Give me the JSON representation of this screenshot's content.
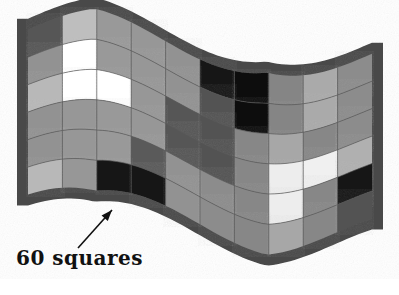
{
  "figure": {
    "kind": "wavy-checkerboard-surface",
    "title": "",
    "background_color": "#ffffff",
    "annotation": {
      "label": "60 squares",
      "arrow": {
        "name": "pointer-arrow",
        "from_x": 78,
        "from_y": 248,
        "to_x": 112,
        "to_y": 210,
        "color": "#111111"
      }
    },
    "surface": {
      "columns": 10,
      "rows": 6,
      "total_squares": 60,
      "border_color": "#4a4a4a",
      "border_thickness": 11,
      "grid_line_color": "#595959",
      "wave": {
        "amplitude_top": 26,
        "amplitude_bottom": 26,
        "periods": 1.0,
        "phase_deg": 200,
        "left_x": 28,
        "right_x": 372,
        "top_y": 36,
        "bottom_y": 218,
        "left_lift": -6,
        "right_lift": 18
      },
      "palette": {
        "white": "#ffffff",
        "light_gray": "#b4b4b4",
        "mid_gray": "#8f8f8f",
        "dark_gray": "#555555",
        "black": "#121212"
      },
      "cells": [
        [
          "dark_gray",
          "light_gray",
          "mid_gray",
          "mid_gray",
          "mid_gray",
          "black",
          "black",
          "mid_gray",
          "light_gray",
          "mid_gray"
        ],
        [
          "mid_gray",
          "white",
          "mid_gray",
          "mid_gray",
          "mid_gray",
          "dark_gray",
          "black",
          "mid_gray",
          "light_gray",
          "mid_gray"
        ],
        [
          "light_gray",
          "white",
          "white",
          "mid_gray",
          "dark_gray",
          "dark_gray",
          "mid_gray",
          "light_gray",
          "mid_gray",
          "mid_gray"
        ],
        [
          "mid_gray",
          "mid_gray",
          "mid_gray",
          "mid_gray",
          "dark_gray",
          "dark_gray",
          "mid_gray",
          "white",
          "white",
          "light_gray"
        ],
        [
          "mid_gray",
          "mid_gray",
          "mid_gray",
          "dark_gray",
          "mid_gray",
          "mid_gray",
          "mid_gray",
          "white",
          "mid_gray",
          "black"
        ],
        [
          "light_gray",
          "mid_gray",
          "black",
          "black",
          "mid_gray",
          "mid_gray",
          "mid_gray",
          "light_gray",
          "mid_gray",
          "dark_gray"
        ]
      ]
    }
  }
}
